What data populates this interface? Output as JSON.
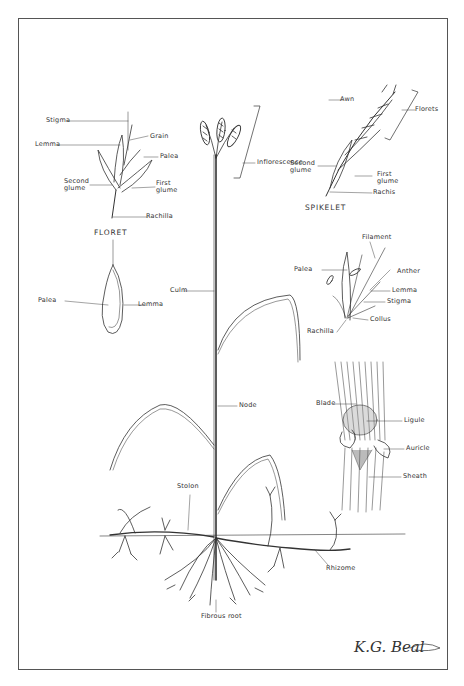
{
  "diagram": {
    "panels": {
      "floret": {
        "caption": "FLORET",
        "labels": [
          "Stigma",
          "Grain",
          "Lemma",
          "Palea",
          "Second glume",
          "First glume",
          "Rachilla"
        ]
      },
      "spikelet": {
        "caption": "SPIKELET",
        "labels": [
          "Awn",
          "Florets",
          "Second glume",
          "First glume",
          "Rachis"
        ]
      },
      "grain": {
        "labels": [
          "Palea",
          "Lemma"
        ]
      },
      "flower": {
        "labels": [
          "Filament",
          "Palea",
          "Anther",
          "Lemma",
          "Stigma",
          "Rachilla",
          "Collus"
        ]
      },
      "collar": {
        "labels": [
          "Blade",
          "Ligule",
          "Auricle",
          "Sheath"
        ]
      },
      "whole_plant": {
        "labels": [
          "Inflorescence",
          "Culm",
          "Node",
          "Stolon",
          "Rhizome",
          "Fibrous root"
        ]
      }
    },
    "signature": "K.G. Beal"
  }
}
